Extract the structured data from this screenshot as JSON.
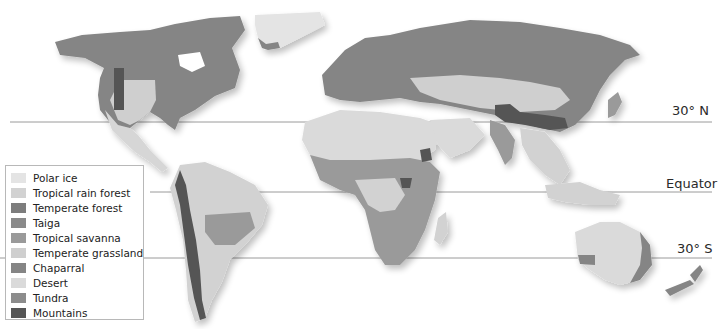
{
  "map": {
    "title": "World Biomes",
    "latitude_lines": [
      {
        "label": "30° N",
        "y": 122
      },
      {
        "label": "Equator",
        "y": 192
      },
      {
        "label": "30° S",
        "y": 258
      }
    ],
    "colors": {
      "polar_ice": "#e4e4e4",
      "tropical_rain_forest": "#d2d2d2",
      "temperate_forest": "#7d7d7d",
      "taiga": "#8a8a8a",
      "tropical_savanna": "#9a9a9a",
      "temperate_grassland": "#cfcfcf",
      "chaparral": "#858585",
      "desert": "#dadada",
      "tundra": "#8c8c8c",
      "mountains": "#555555"
    }
  },
  "legend": {
    "items": [
      {
        "label": "Polar ice",
        "color": "#e4e4e4"
      },
      {
        "label": "Tropical rain forest",
        "color": "#d2d2d2"
      },
      {
        "label": "Temperate forest",
        "color": "#7d7d7d"
      },
      {
        "label": "Taiga",
        "color": "#8a8a8a"
      },
      {
        "label": "Tropical savanna",
        "color": "#9a9a9a"
      },
      {
        "label": "Temperate grassland",
        "color": "#cfcfcf"
      },
      {
        "label": "Chaparral",
        "color": "#858585"
      },
      {
        "label": "Desert",
        "color": "#dadada"
      },
      {
        "label": "Tundra",
        "color": "#8c8c8c"
      },
      {
        "label": "Mountains",
        "color": "#555555"
      }
    ]
  }
}
